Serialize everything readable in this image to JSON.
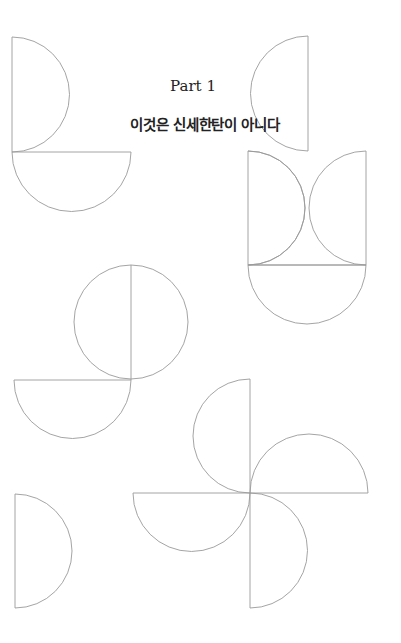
{
  "page": {
    "part_label": "Part 1",
    "chapter_title": "이것은 신세한탄이 아니다"
  },
  "style": {
    "stroke_color": "#9a9a9a",
    "text_color": "#222222",
    "background": "#ffffff"
  },
  "shapes": [
    {
      "name": "top-left-half-disc-right",
      "type": "semicircle"
    },
    {
      "name": "top-left-half-disc-down",
      "type": "semicircle"
    },
    {
      "name": "top-right-half-disc-right",
      "type": "semicircle"
    },
    {
      "name": "right-box-double-arcs",
      "type": "composite"
    },
    {
      "name": "right-half-disc-down",
      "type": "semicircle"
    },
    {
      "name": "middle-circle-with-divider",
      "type": "circle"
    },
    {
      "name": "middle-half-disc-down",
      "type": "semicircle"
    },
    {
      "name": "pinwheel",
      "type": "composite"
    },
    {
      "name": "bottom-left-half-disc-right",
      "type": "semicircle"
    }
  ]
}
